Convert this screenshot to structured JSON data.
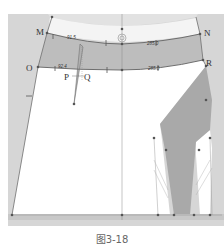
{
  "figure": {
    "caption": "图3-18",
    "points": {
      "M": "M",
      "N": "N",
      "O": "O",
      "P": "P",
      "Q": "Q",
      "R": "R"
    },
    "measurements": {
      "waistband_top_left": "91.5",
      "waistband_top_right": "285.0",
      "waistband_bottom_left": "92.4",
      "waistband_bottom_right": "285.0"
    },
    "colors": {
      "background_gray": "#d4d4d4",
      "band_gray": "#c2c2c2",
      "panel_white": "#ffffff",
      "dark_gray": "#a8a8a8",
      "line": "#6e6e6e",
      "point": "#555555"
    }
  }
}
